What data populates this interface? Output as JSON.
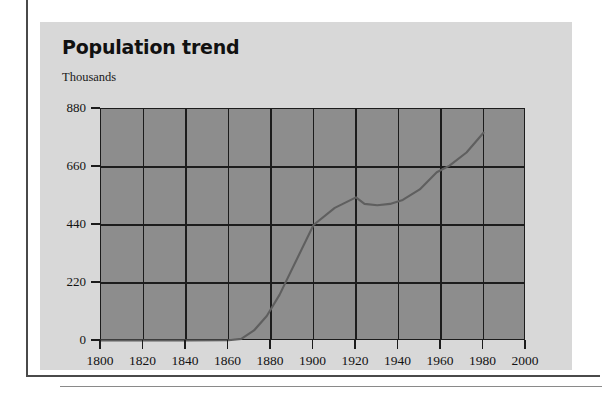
{
  "chart_data": {
    "type": "line",
    "title": "Population trend",
    "subtitle": "",
    "ylabel": "Thousands",
    "xlabel": "",
    "xlim": [
      1800,
      2000
    ],
    "ylim": [
      0,
      880
    ],
    "grid": true,
    "legend": false,
    "y_ticks": [
      880,
      660,
      440,
      220,
      0
    ],
    "x_ticks": [
      1800,
      1820,
      1840,
      1860,
      1880,
      1900,
      1920,
      1940,
      1960,
      1980,
      2000
    ],
    "series": [
      {
        "name": "Population",
        "color": "#5f5f5f",
        "x": [
          1800,
          1820,
          1840,
          1860,
          1866,
          1872,
          1878,
          1884,
          1900,
          1910,
          1920,
          1924,
          1930,
          1936,
          1942,
          1950,
          1958,
          1964,
          1972,
          1980
        ],
        "values": [
          2,
          2,
          2,
          3,
          8,
          40,
          95,
          175,
          440,
          505,
          545,
          520,
          515,
          520,
          535,
          575,
          640,
          665,
          715,
          790
        ]
      }
    ],
    "colors": {
      "plot_background": "#8d8d8d",
      "panel_background": "#d8d8d8",
      "axis": "#1c1c1c",
      "line": "#5f5f5f",
      "page_rule": "#4a4a4a",
      "text": "#121212"
    }
  },
  "figure": {
    "title": "Population trend",
    "unit_label": "Thousands"
  }
}
